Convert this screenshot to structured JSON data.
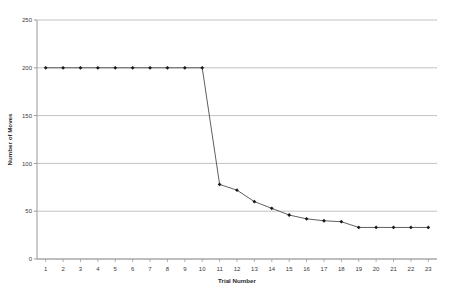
{
  "chart_data": {
    "type": "line",
    "title": "",
    "xlabel": "Trial Number",
    "ylabel": "Number of Moves",
    "categories": [
      1,
      2,
      3,
      4,
      5,
      6,
      7,
      8,
      9,
      10,
      11,
      12,
      13,
      14,
      15,
      16,
      17,
      18,
      19,
      20,
      21,
      22,
      23
    ],
    "values": [
      200,
      200,
      200,
      200,
      200,
      200,
      200,
      200,
      200,
      200,
      78,
      72,
      60,
      53,
      46,
      42,
      40,
      39,
      33,
      33,
      33,
      33,
      33
    ],
    "series": [
      {
        "name": "Number of Moves",
        "values": [
          200,
          200,
          200,
          200,
          200,
          200,
          200,
          200,
          200,
          200,
          78,
          72,
          60,
          53,
          46,
          42,
          40,
          39,
          33,
          33,
          33,
          33,
          33
        ]
      }
    ],
    "xlim": [
      0.5,
      23.5
    ],
    "ylim": [
      0,
      250
    ],
    "ytick_labels": [
      "0",
      "50",
      "100",
      "150",
      "200",
      "250"
    ],
    "yticks": [
      0,
      50,
      100,
      150,
      200,
      250
    ],
    "xtick_labels": [
      "1",
      "2",
      "3",
      "4",
      "5",
      "6",
      "7",
      "8",
      "9",
      "10",
      "11",
      "12",
      "13",
      "14",
      "15",
      "16",
      "17",
      "18",
      "19",
      "20",
      "21",
      "22",
      "23"
    ],
    "grid": "horizontal",
    "legend": "none",
    "marker": "filled-diamond",
    "line_color": "#4d4d4d",
    "marker_color": "#1a1a1a",
    "grid_color": "#b3b3b3",
    "axis_color": "#9a9a9a",
    "background_color": "#ffffff"
  }
}
